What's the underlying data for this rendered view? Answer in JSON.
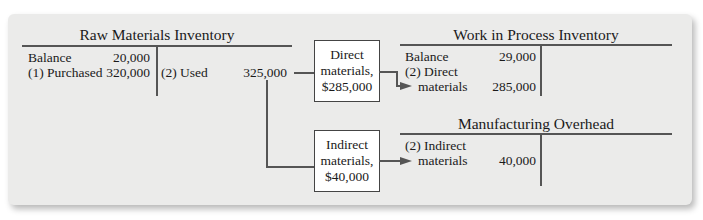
{
  "raw_materials": {
    "title": "Raw Materials Inventory",
    "debits": [
      {
        "label": "Balance",
        "amount": "20,000"
      },
      {
        "label": "(1) Purchased",
        "amount": "320,000"
      }
    ],
    "credits": [
      {
        "label": "(2) Used",
        "amount": "325,000"
      }
    ]
  },
  "direct_box": {
    "line1": "Direct",
    "line2": "materials,",
    "line3": "$285,000"
  },
  "indirect_box": {
    "line1": "Indirect",
    "line2": "materials,",
    "line3": "$40,000"
  },
  "wip": {
    "title": "Work in Process Inventory",
    "debits": [
      {
        "label": "Balance",
        "amount": "29,000"
      },
      {
        "label_line1": "(2) Direct",
        "label_line2": "materials",
        "amount": "285,000"
      }
    ]
  },
  "overhead": {
    "title": "Manufacturing Overhead",
    "debits": [
      {
        "label_line1": "(2) Indirect",
        "label_line2": "materials",
        "amount": "40,000"
      }
    ]
  },
  "colors": {
    "panel": "#ebebea",
    "line": "#555555",
    "box": "#ffffff"
  }
}
